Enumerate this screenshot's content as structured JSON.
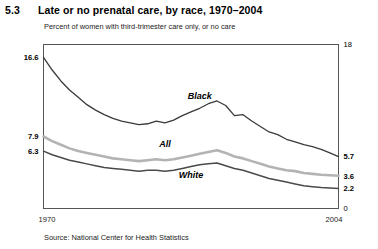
{
  "figure": {
    "number": "5.3",
    "title": "Late or no prenatal care, by race, 1970–2004",
    "subtitle": "Percent of women with third-trimester care only, or no care",
    "source": "Source: National Center for Health Statistics"
  },
  "chart_data": {
    "type": "line",
    "title": "Late or no prenatal care, by race, 1970–2004",
    "subtitle": "Percent of women with third-trimester care only, or no care",
    "xlabel": "",
    "ylabel": "Percent",
    "xlim": [
      1970,
      2004
    ],
    "ylim": [
      0,
      18
    ],
    "grid": false,
    "legend_position": "inline-labels",
    "x_tick_labels": [
      "1970",
      "2004"
    ],
    "left_axis_labels": [
      "16.6",
      "7.9",
      "6.3"
    ],
    "right_axis_labels": [
      "18",
      "5.7",
      "3.6",
      "2.2",
      "0"
    ],
    "x": [
      1970,
      1971,
      1972,
      1973,
      1974,
      1975,
      1976,
      1977,
      1978,
      1979,
      1980,
      1981,
      1982,
      1983,
      1984,
      1985,
      1986,
      1987,
      1988,
      1989,
      1990,
      1991,
      1992,
      1993,
      1994,
      1995,
      1996,
      1997,
      1998,
      1999,
      2000,
      2001,
      2002,
      2003,
      2004
    ],
    "series": [
      {
        "name": "Black",
        "color": "#3a3a3a",
        "width": 1.3,
        "label_x": 1988,
        "label_y": 12.0,
        "start_value": 16.6,
        "end_value": 5.7,
        "values": [
          16.6,
          15.2,
          14.0,
          13.0,
          12.2,
          11.4,
          10.8,
          10.3,
          9.9,
          9.6,
          9.4,
          9.2,
          9.3,
          9.6,
          9.4,
          9.7,
          10.2,
          10.6,
          11.0,
          11.5,
          11.8,
          11.3,
          10.2,
          10.3,
          9.6,
          9.0,
          8.4,
          8.1,
          7.6,
          7.3,
          7.0,
          6.8,
          6.5,
          6.1,
          5.7
        ]
      },
      {
        "name": "All",
        "color": "#b3b3b3",
        "width": 2.6,
        "label_x": 1984,
        "label_y": 6.8,
        "start_value": 7.9,
        "end_value": 3.6,
        "values": [
          7.9,
          7.4,
          7.0,
          6.6,
          6.3,
          6.1,
          5.9,
          5.7,
          5.5,
          5.4,
          5.3,
          5.2,
          5.3,
          5.4,
          5.3,
          5.4,
          5.6,
          5.8,
          6.0,
          6.2,
          6.4,
          6.1,
          5.7,
          5.5,
          5.2,
          4.9,
          4.6,
          4.4,
          4.2,
          4.1,
          3.9,
          3.8,
          3.7,
          3.65,
          3.6
        ]
      },
      {
        "name": "White",
        "color": "#4a4a4a",
        "width": 1.5,
        "label_x": 1987,
        "label_y": 3.3,
        "start_value": 6.3,
        "end_value": 2.2,
        "values": [
          6.3,
          5.9,
          5.6,
          5.3,
          5.1,
          4.9,
          4.7,
          4.5,
          4.4,
          4.3,
          4.2,
          4.1,
          4.2,
          4.2,
          4.1,
          4.2,
          4.4,
          4.6,
          4.8,
          4.9,
          5.0,
          4.7,
          4.4,
          4.2,
          3.9,
          3.6,
          3.3,
          3.1,
          2.9,
          2.7,
          2.5,
          2.4,
          2.3,
          2.25,
          2.2
        ]
      }
    ]
  }
}
